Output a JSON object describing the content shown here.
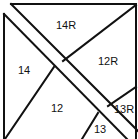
{
  "diagram": {
    "type": "tangram-style piece layout",
    "labels": {
      "p14R": "14R",
      "p12R": "12R",
      "p14": "14",
      "p12": "12",
      "p13R": "13R",
      "p13": "13"
    },
    "colors": {
      "stroke": "#111111",
      "background": "#ffffff"
    }
  }
}
